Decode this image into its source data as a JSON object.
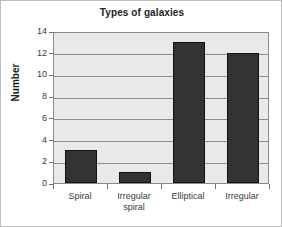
{
  "chart_data": {
    "type": "bar",
    "title": "Types of galaxies",
    "subtitle": "",
    "xlabel": "",
    "ylabel": "Number",
    "categories": [
      "Spiral",
      "Irregular spiral",
      "Elliptical",
      "Irregular"
    ],
    "category_lines": [
      [
        "Spiral"
      ],
      [
        "Irregular",
        "spiral"
      ],
      [
        "Elliptical"
      ],
      [
        "Irregular"
      ]
    ],
    "values": [
      3,
      1,
      13,
      12
    ],
    "ylim": [
      0,
      14
    ],
    "ytick_step": 2,
    "yticks": [
      0,
      2,
      4,
      6,
      8,
      10,
      12,
      14
    ],
    "ytick_labels": [
      "0",
      "2",
      "4",
      "6",
      "8",
      "10",
      "12",
      "14"
    ],
    "grid": true,
    "grid_axis": "y",
    "legend": false,
    "legend_position": "none",
    "colors": {
      "bar_fill": "#333333",
      "bar_border": "#111111",
      "plot_background": "#e9e9e9",
      "gridline": "#8e8e8e",
      "axis": "#8a8a8a",
      "title_text": "#222222",
      "label_text": "#3a3a3a",
      "page_background": "#ffffff",
      "frame_border": "#bdbdbd"
    }
  }
}
